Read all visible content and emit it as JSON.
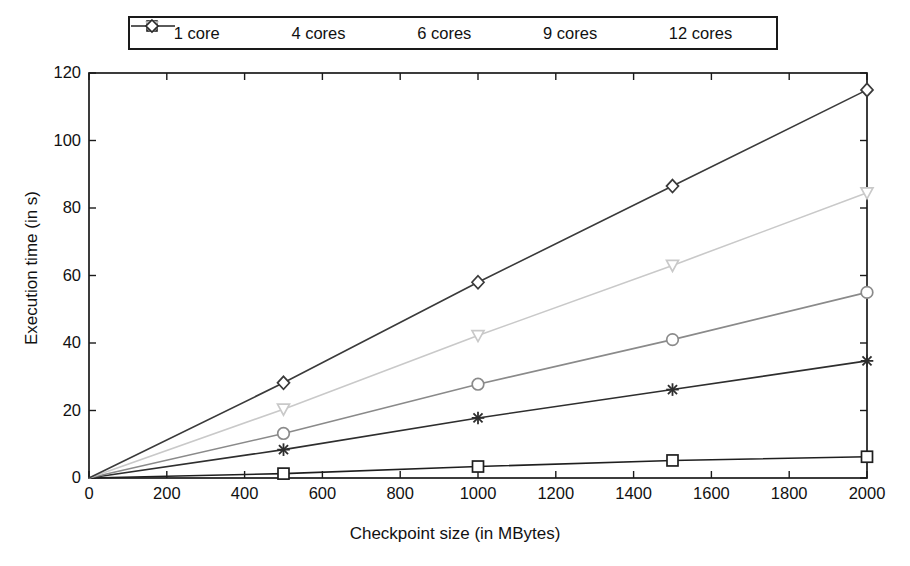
{
  "chart_data": {
    "type": "line",
    "title": "",
    "xlabel": "Checkpoint size (in MBytes)",
    "ylabel": "Execution time (in s)",
    "xlim": [
      0,
      2000
    ],
    "ylim": [
      0,
      120
    ],
    "xticks": [
      0,
      200,
      400,
      600,
      800,
      1000,
      1200,
      1400,
      1600,
      1800,
      2000
    ],
    "yticks": [
      0,
      20,
      40,
      60,
      80,
      100,
      120
    ],
    "grid": false,
    "legend_position": "top-outside",
    "x": [
      0,
      500,
      1000,
      1500,
      2000
    ],
    "series": [
      {
        "name": "1 core",
        "marker": "square",
        "color": "#1f1f1f",
        "values": [
          0,
          1.3,
          3.4,
          5.2,
          6.3
        ]
      },
      {
        "name": "4 cores",
        "marker": "star",
        "color": "#2e2e2e",
        "values": [
          0,
          8.4,
          17.8,
          26.2,
          34.7
        ]
      },
      {
        "name": "6 cores",
        "marker": "circle",
        "color": "#8a8a8a",
        "values": [
          0,
          13.2,
          27.8,
          41.0,
          55.0
        ]
      },
      {
        "name": "9 cores",
        "marker": "triangle",
        "color": "#c9c9c9",
        "values": [
          0,
          20.4,
          42.2,
          63.0,
          84.5
        ]
      },
      {
        "name": "12 cores",
        "marker": "diamond",
        "color": "#3a3a3a",
        "values": [
          0,
          28.2,
          58.0,
          86.5,
          115.0
        ]
      }
    ]
  },
  "legend": {
    "items": [
      {
        "label": "1 core"
      },
      {
        "label": "4 cores"
      },
      {
        "label": "6 cores"
      },
      {
        "label": "9 cores"
      },
      {
        "label": "12 cores"
      }
    ]
  },
  "axes": {
    "x_title": "Checkpoint size (in MBytes)",
    "y_title": "Execution time (in s)",
    "x_tick_labels": [
      "0",
      "200",
      "400",
      "600",
      "800",
      "1000",
      "1200",
      "1400",
      "1600",
      "1800",
      "2000"
    ],
    "y_tick_labels": [
      "0",
      "20",
      "40",
      "60",
      "80",
      "100",
      "120"
    ]
  },
  "colors": {
    "axis": "#1a1a1a",
    "background": "#ffffff",
    "text": "#111111"
  }
}
